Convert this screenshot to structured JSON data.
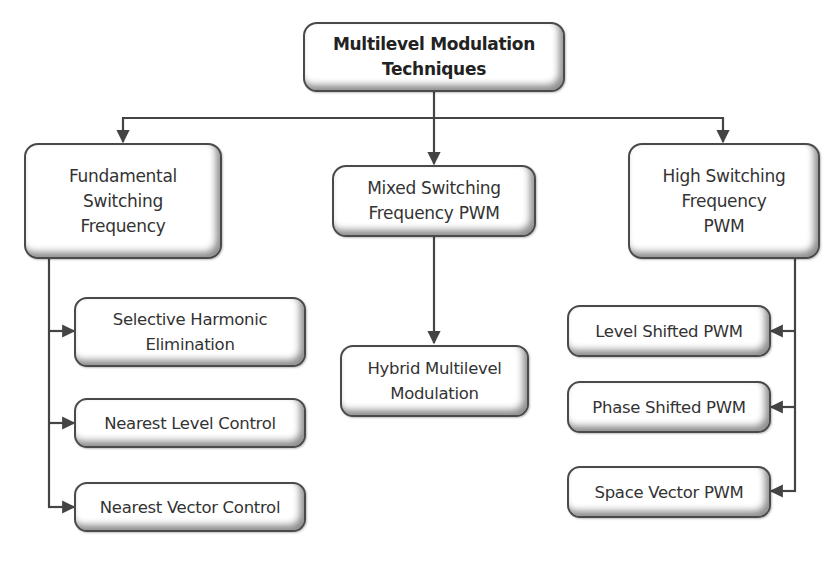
{
  "diagram": {
    "type": "hierarchy-tree",
    "root": {
      "label": "Multilevel Modulation\nTechniques"
    },
    "categories": [
      {
        "label": "Fundamental\nSwitching\nFrequency",
        "children": [
          {
            "label": "Selective Harmonic\nElimination"
          },
          {
            "label": "Nearest Level Control"
          },
          {
            "label": "Nearest Vector Control"
          }
        ]
      },
      {
        "label": "Mixed Switching\nFrequency PWM",
        "children": [
          {
            "label": "Hybrid Multilevel\nModulation"
          }
        ]
      },
      {
        "label": "High Switching\nFrequency\nPWM",
        "children": [
          {
            "label": "Level Shifted PWM"
          },
          {
            "label": "Phase Shifted PWM"
          },
          {
            "label": "Space Vector PWM"
          }
        ]
      }
    ],
    "colors": {
      "line": "#444444",
      "box_border": "#4a4a4a",
      "box_fill": "#ffffff",
      "text": "#333333"
    }
  }
}
